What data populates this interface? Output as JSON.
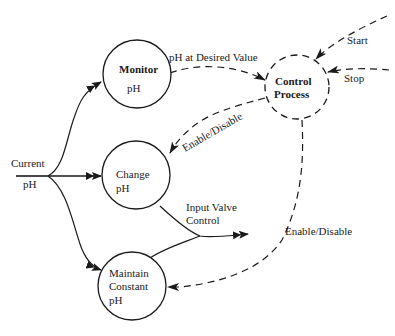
{
  "diagram": {
    "type": "data-flow-diagram",
    "colors": {
      "ink": "#1a1a1a",
      "background": "#ffffff"
    },
    "nodes": {
      "monitor": {
        "line1": "Monitor",
        "line2": "pH",
        "style": "solid"
      },
      "control": {
        "line1": "Control",
        "line2": "Process",
        "style": "dashed"
      },
      "change": {
        "line1": "Change",
        "line2": "pH",
        "style": "solid"
      },
      "maintain": {
        "line1": "Maintain",
        "line2": "Constant",
        "line3": "pH",
        "style": "solid"
      }
    },
    "flows": {
      "current_ph_line1": "Current",
      "current_ph_line2": "pH",
      "ph_desired": "pH at Desired Value",
      "start": "Start",
      "stop": "Stop",
      "enable_disable_change": "Enable/Disable",
      "input_valve_line1": "Input Valve",
      "input_valve_line2": "Control",
      "enable_disable_maintain": "Enable/Disable"
    }
  }
}
